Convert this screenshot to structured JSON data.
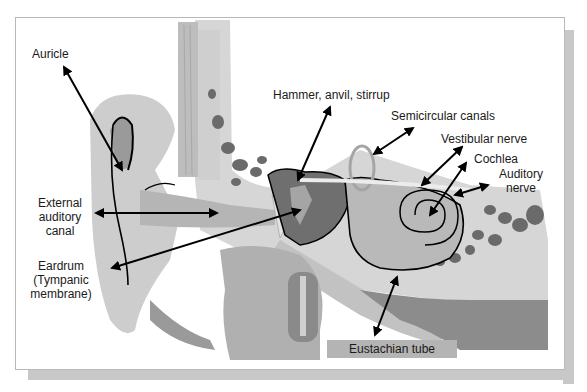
{
  "diagram": {
    "labels": {
      "auricle": "Auricle",
      "external_auditory_canal": [
        "External",
        "auditory",
        "canal"
      ],
      "eardrum": [
        "Eardrum",
        "(Tympanic",
        "membrane)"
      ],
      "ossicles": "Hammer, anvil, stirrup",
      "semicircular_canals": "Semicircular canals",
      "vestibular_nerve": "Vestibular nerve",
      "cochlea": "Cochlea",
      "auditory_nerve": [
        "Auditory",
        "nerve"
      ],
      "eustachian_tube": "Eustachian tube"
    },
    "colors": {
      "background": "#ffffff",
      "light_tissue": "#d9d9d9",
      "mid_tissue": "#b0b0b0",
      "dark_tissue": "#6e6e6e",
      "bone_cavities": "#5a5a5a",
      "arrow": "#000000",
      "frame_shadow": "#c8c8c8"
    }
  }
}
